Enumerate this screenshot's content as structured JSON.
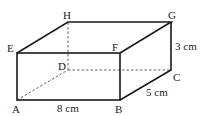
{
  "figure": {
    "type": "rectangular-prism",
    "vertices": {
      "A": {
        "label": "A",
        "x": 17,
        "y": 100
      },
      "B": {
        "label": "B",
        "x": 120,
        "y": 100
      },
      "C": {
        "label": "C",
        "x": 171,
        "y": 70
      },
      "D": {
        "label": "D",
        "x": 68,
        "y": 70
      },
      "E": {
        "label": "E",
        "x": 17,
        "y": 53
      },
      "F": {
        "label": "F",
        "x": 120,
        "y": 53
      },
      "G": {
        "label": "G",
        "x": 171,
        "y": 22
      },
      "H": {
        "label": "H",
        "x": 68,
        "y": 22
      }
    },
    "dimensions": {
      "AB": "8 cm",
      "BC": "5 cm",
      "CG": "3 cm"
    },
    "hidden_edges": [
      "AD",
      "DC",
      "DH"
    ]
  }
}
